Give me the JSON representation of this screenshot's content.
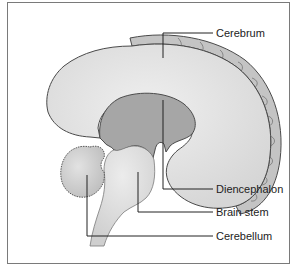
{
  "diagram": {
    "type": "anatomical-illustration",
    "labels": [
      {
        "id": "cerebrum",
        "text": "Cerebrum"
      },
      {
        "id": "diencephalon",
        "text": "Diencephalon"
      },
      {
        "id": "brain-stem",
        "text": "Brain stem"
      },
      {
        "id": "cerebellum",
        "text": "Cerebellum"
      }
    ],
    "colors": {
      "cerebrum_fill": "#e4e4e4",
      "cortex_fill": "#c9c9c9",
      "diencephalon_fill": "#a9a9a9",
      "brainstem_fill": "#e0e0e0",
      "cerebellum_fill": "#d2d2d2",
      "outline": "#4a4a4a",
      "frame": "#7a7a7a"
    }
  }
}
